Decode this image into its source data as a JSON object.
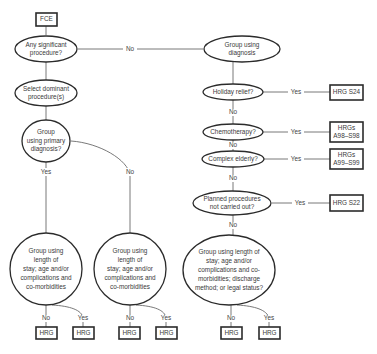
{
  "diagram": {
    "start": {
      "label": "FCE"
    },
    "nodes": {
      "any_procedure": {
        "lines": [
          "Any significant",
          "procedure?"
        ]
      },
      "select_dominant": {
        "lines": [
          "Select dominant",
          "procedure(s)"
        ]
      },
      "primary_diagnosis": {
        "lines": [
          "Group",
          "using primary",
          "diagnosis?"
        ]
      },
      "los_left_yes": {
        "lines": [
          "Group using",
          "length of",
          "stay; age and/or",
          "complications and",
          "co-morbidities"
        ]
      },
      "los_left_no": {
        "lines": [
          "Group using",
          "length of",
          "stay; age and/or",
          "complications and",
          "co-morbidities"
        ]
      },
      "group_diagnosis": {
        "lines": [
          "Group using",
          "diagnosis"
        ]
      },
      "holiday_relief": {
        "lines": [
          "Holiday relief?"
        ]
      },
      "chemotherapy": {
        "lines": [
          "Chemotherapy?"
        ]
      },
      "complex_elderly": {
        "lines": [
          "Complex elderly?"
        ]
      },
      "planned_not_done": {
        "lines": [
          "Planned procedures",
          "not carried out?"
        ]
      },
      "los_right": {
        "lines": [
          "Group using length of",
          "stay; age and/or",
          "complications and co-",
          "morbidities; discharge",
          "method; or legal status?"
        ]
      }
    },
    "outcomes": {
      "hrg_s24": {
        "lines": [
          "HRG S24"
        ]
      },
      "hrgs_a98": {
        "lines": [
          "HRGs",
          "A98–S98"
        ]
      },
      "hrgs_a99": {
        "lines": [
          "HRGs",
          "A99–S99"
        ]
      },
      "hrg_s22": {
        "lines": [
          "HRG S22"
        ]
      },
      "hrg_generic": "HRG"
    },
    "edge_labels": {
      "yes": "Yes",
      "no": "No"
    }
  }
}
